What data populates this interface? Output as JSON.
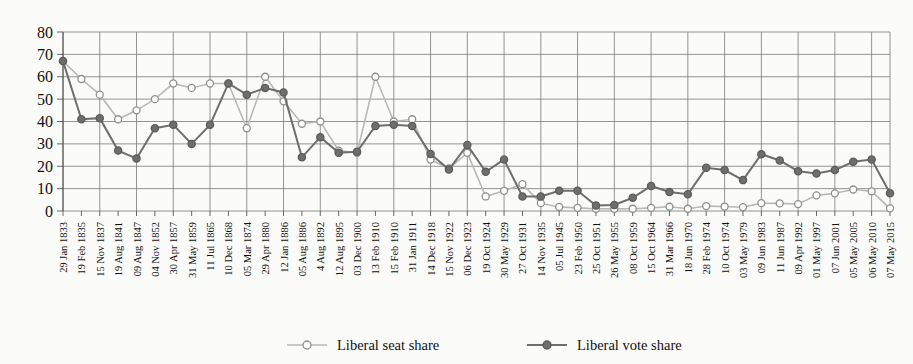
{
  "chart_data": {
    "type": "line",
    "title": "",
    "subtitle": "",
    "xlabel": "",
    "ylabel": "",
    "ylim": [
      0,
      80
    ],
    "yticks": [
      0,
      10,
      20,
      30,
      40,
      50,
      60,
      70,
      80
    ],
    "grid": true,
    "legend_position": "bottom",
    "categories": [
      "29 Jan 1833",
      "19 Feb 1835",
      "15 Nov 1837",
      "19 Aug 1841",
      "09 Aug 1847",
      "04 Nov 1852",
      "30 Apr 1857",
      "31 May 1859",
      "11 Jul 1865",
      "10 Dec 1868",
      "05 Mar 1874",
      "29 Apr 1880",
      "12 Jan 1886",
      "05 Aug 1886",
      "4 Aug 1892",
      "12 Aug 1895",
      "03 Dec 1900",
      "13 Feb 1910",
      "15 Feb 1910",
      "31 Jan 1911",
      "14 Dec 1918",
      "15 Nov 1922",
      "06 Dec 1923",
      "19 Oct 1924",
      "30 May 1929",
      "27 Oct 1931",
      "14 Nov 1935",
      "05 Jul 1945",
      "23 Feb 1950",
      "25 Oct 1951",
      "26 May 1955",
      "08 Oct 1959",
      "15 Oct 1964",
      "31 Mar 1966",
      "18 Jun 1970",
      "28 Feb 1974",
      "10 Oct 1974",
      "03 May 1979",
      "09 Jun 1983",
      "11 Jun 1987",
      "09 Apr 1992",
      "01 May 1997",
      "07 Jun 2001",
      "05 May 2005",
      "06 May 2010",
      "07 May 2015"
    ],
    "series": [
      {
        "name": "Liberal seat share",
        "marker": "open-circle",
        "color": "#b8b8b8",
        "values": [
          67,
          59,
          52,
          41,
          45,
          50,
          57,
          55,
          57,
          57,
          37,
          60,
          49,
          39,
          40,
          27,
          26,
          60,
          40,
          41,
          23,
          19,
          26,
          6.5,
          9,
          12,
          3.5,
          1.8,
          1.4,
          1,
          1,
          1,
          1.4,
          1.9,
          1,
          2.2,
          2,
          1.7,
          3.5,
          3.4,
          3.1,
          7,
          7.9,
          9.6,
          8.8,
          1.2
        ]
      },
      {
        "name": "Liberal vote share",
        "marker": "filled-circle",
        "color": "#6e6e6e",
        "values": [
          67,
          41,
          41.5,
          27,
          23.5,
          37,
          38.5,
          30,
          38.5,
          57,
          52,
          55,
          53,
          24,
          33,
          26,
          26.5,
          38,
          38.5,
          38,
          25.5,
          18.5,
          29.5,
          17.5,
          23,
          6.5,
          6.5,
          9,
          9.1,
          2.5,
          2.7,
          5.9,
          11.2,
          8.5,
          7.5,
          19.3,
          18.3,
          13.8,
          25.4,
          22.6,
          17.8,
          16.8,
          18.3,
          22,
          23,
          7.9
        ]
      }
    ],
    "legend": [
      {
        "label": "Liberal seat share",
        "marker": "open-circle",
        "color": "#b8b8b8"
      },
      {
        "label": "Liberal vote share",
        "marker": "filled-circle",
        "color": "#6e6e6e"
      }
    ]
  }
}
